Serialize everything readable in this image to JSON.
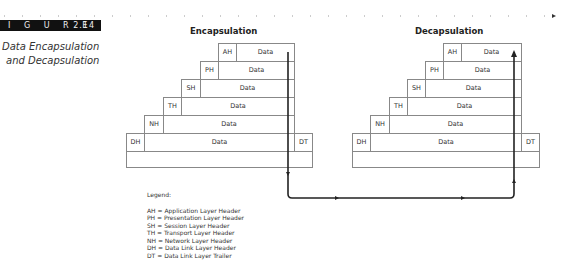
{
  "figure": {
    "tag_label": "I G U R E",
    "number": "2.14",
    "caption_line1": "Data Encapsulation",
    "caption_line2": "and Decapsulation"
  },
  "encapsulation": {
    "title": "Encapsulation",
    "rows": [
      {
        "header": "AH",
        "body": "Data"
      },
      {
        "header": "PH",
        "body": "Data"
      },
      {
        "header": "SH",
        "body": "Data"
      },
      {
        "header": "TH",
        "body": "Data"
      },
      {
        "header": "NH",
        "body": "Data"
      },
      {
        "header": "DH",
        "body": "Data",
        "trailer": "DT"
      }
    ]
  },
  "decapsulation": {
    "title": "Decapsulation",
    "rows": [
      {
        "header": "AH",
        "body": "Data"
      },
      {
        "header": "PH",
        "body": "Data"
      },
      {
        "header": "SH",
        "body": "Data"
      },
      {
        "header": "TH",
        "body": "Data"
      },
      {
        "header": "NH",
        "body": "Data"
      },
      {
        "header": "DH",
        "body": "Data",
        "trailer": "DT"
      }
    ]
  },
  "legend": {
    "title": "Legend:",
    "items": [
      "AH = Application Layer Header",
      "PH = Presentation Layer Header",
      "SH = Session Layer Header",
      "TH = Transport Layer Header",
      "NH = Network Layer Header",
      "DH = Data Link Layer Header",
      "DT = Data Link Layer Trailer"
    ]
  },
  "colors": {
    "box_border": "#888888",
    "arrow": "#222222",
    "tag_bg": "#111111"
  }
}
